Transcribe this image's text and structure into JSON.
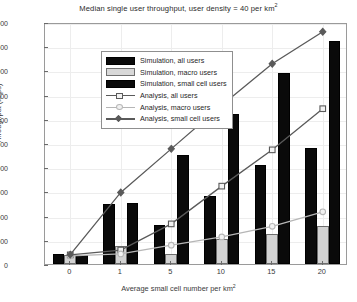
{
  "chart_data": {
    "type": "bar",
    "title": "Median single user throughput, user density = 40 per km",
    "title_sup": "2",
    "xlabel": "Average small cell number per km",
    "xlabel_sup": "2",
    "ylabel": "Throughput (kbps)",
    "categories": [
      "0",
      "1",
      "5",
      "10",
      "15",
      "20"
    ],
    "ylim": [
      0,
      5000
    ],
    "yticks": [
      0,
      500,
      1000,
      1500,
      2000,
      2500,
      3000,
      3500,
      4000,
      4500,
      5000
    ],
    "grid": true,
    "legend_position": "upper-left",
    "series": [
      {
        "name": "Simulation, all users",
        "kind": "bar",
        "color": "#0a0a0a",
        "values": [
          210,
          1250,
          800,
          1400,
          2050,
          2400
        ]
      },
      {
        "name": "Simulation, macro users",
        "kind": "bar",
        "color": "#d2d2d2",
        "values": [
          185,
          380,
          215,
          520,
          620,
          780
        ]
      },
      {
        "name": "Simulation, small cell users",
        "kind": "bar",
        "color": "#0a0a0a",
        "values": [
          195,
          1270,
          2250,
          3100,
          3950,
          4600
        ]
      },
      {
        "name": "Analysis, all users",
        "kind": "line",
        "marker": "square",
        "color": "#5a5a5a",
        "values": [
          230,
          330,
          870,
          1650,
          2400,
          3250
        ]
      },
      {
        "name": "Analysis, macro users",
        "kind": "line",
        "marker": "circle",
        "color": "#b6b6b6",
        "values": [
          210,
          250,
          430,
          600,
          820,
          1120
        ]
      },
      {
        "name": "Analysis, small cell users",
        "kind": "line",
        "marker": "diamond",
        "color": "#5a5a5a",
        "values": [
          235,
          1520,
          2420,
          3320,
          4180,
          4840
        ]
      }
    ]
  }
}
